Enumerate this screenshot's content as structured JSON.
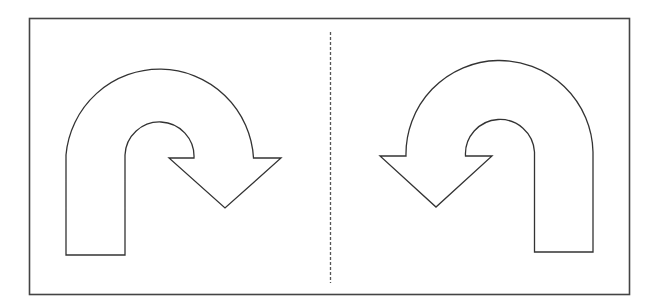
{
  "diagram": {
    "title": "",
    "panels": [
      {
        "id": "left",
        "symbol": "u-turn-right-arrow"
      },
      {
        "id": "right",
        "symbol": "u-turn-left-arrow"
      }
    ],
    "divider": "dashed-vertical-line",
    "colors": {
      "background": "#ffffff",
      "stroke": "#333333",
      "frame": "#444444",
      "divider": "#555555"
    }
  }
}
